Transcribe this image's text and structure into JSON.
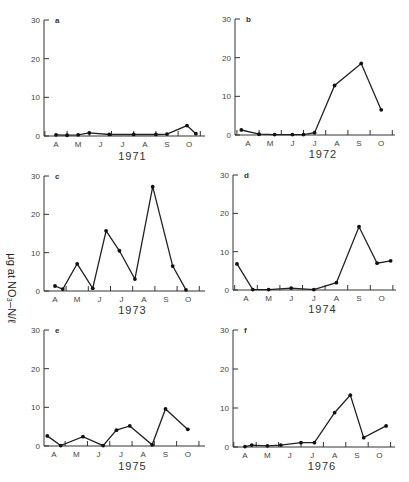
{
  "figure": {
    "ylabel": "μg at NO₃–N/ℓ"
  },
  "chart_data": [
    {
      "type": "line",
      "panel": "a",
      "title": "1971",
      "xlabel": "1971",
      "ylabel": "μg at NO₃–N/ℓ",
      "x_ticks": [
        "A",
        "M",
        "J",
        "J",
        "A",
        "S",
        "O"
      ],
      "yticks": [
        0,
        10,
        20,
        30
      ],
      "ylim": [
        0,
        30
      ],
      "grid": false,
      "x": [
        0.0,
        0.5,
        1.0,
        1.5,
        2.4,
        3.5,
        4.5,
        5.0,
        5.9,
        6.3
      ],
      "values": [
        0.3,
        0.2,
        0.3,
        0.8,
        0.4,
        0.4,
        0.4,
        0.5,
        2.7,
        0.6
      ]
    },
    {
      "type": "line",
      "panel": "b",
      "title": "1972",
      "xlabel": "1972",
      "ylabel": "μg at NO₃–N/ℓ",
      "x_ticks": [
        "A",
        "M",
        "J",
        "J",
        "A",
        "S",
        "O"
      ],
      "yticks": [
        0,
        10,
        20,
        30
      ],
      "ylim": [
        0,
        30
      ],
      "grid": false,
      "x": [
        -0.3,
        0.5,
        1.2,
        2.0,
        2.5,
        3.0,
        3.9,
        5.1,
        6.0
      ],
      "values": [
        1.3,
        0.2,
        0.1,
        0.1,
        0.1,
        0.6,
        12.8,
        18.5,
        6.5
      ]
    },
    {
      "type": "line",
      "panel": "c",
      "title": "1973",
      "xlabel": "1973",
      "ylabel": "μg at NO₃–N/ℓ",
      "x_ticks": [
        "A",
        "M",
        "J",
        "J",
        "A",
        "S",
        "O"
      ],
      "yticks": [
        0,
        10,
        20,
        30
      ],
      "ylim": [
        0,
        30
      ],
      "grid": false,
      "x": [
        0.0,
        0.35,
        1.0,
        1.7,
        2.3,
        2.9,
        3.6,
        4.4,
        5.3,
        5.9
      ],
      "values": [
        1.3,
        0.5,
        7.1,
        0.7,
        15.7,
        10.5,
        3.1,
        27.2,
        6.5,
        0.3
      ]
    },
    {
      "type": "line",
      "panel": "d",
      "title": "1974",
      "xlabel": "1974",
      "ylabel": "μg at NO₃–N/ℓ",
      "x_ticks": [
        "A",
        "M",
        "J",
        "J",
        "A",
        "S",
        "O"
      ],
      "yticks": [
        0,
        10,
        20,
        30
      ],
      "ylim": [
        0,
        30
      ],
      "grid": false,
      "x": [
        -0.4,
        0.3,
        1.0,
        2.0,
        3.0,
        4.0,
        5.0,
        5.8,
        6.4
      ],
      "values": [
        6.8,
        0.1,
        0.1,
        0.5,
        0.1,
        1.9,
        16.5,
        7.0,
        7.6
      ]
    },
    {
      "type": "line",
      "panel": "e",
      "title": "1975",
      "xlabel": "1975",
      "ylabel": "μg at NO₃–N/ℓ",
      "x_ticks": [
        "A",
        "M",
        "J",
        "J",
        "A",
        "S",
        "O"
      ],
      "yticks": [
        0,
        10,
        20,
        30
      ],
      "ylim": [
        0,
        30
      ],
      "grid": false,
      "x": [
        -0.3,
        0.3,
        1.3,
        2.2,
        2.8,
        3.4,
        4.4,
        5.0,
        6.0
      ],
      "values": [
        2.6,
        0.1,
        2.4,
        0.1,
        4.1,
        5.2,
        0.3,
        9.6,
        4.3
      ]
    },
    {
      "type": "line",
      "panel": "f",
      "title": "1976",
      "xlabel": "1976",
      "ylabel": "μg at NO₃–N/ℓ",
      "x_ticks": [
        "A",
        "M",
        "J",
        "J",
        "A",
        "S",
        "O"
      ],
      "yticks": [
        0,
        10,
        20,
        30
      ],
      "ylim": [
        0,
        30
      ],
      "grid": false,
      "x": [
        0.0,
        0.3,
        1.0,
        1.6,
        2.5,
        3.1,
        4.0,
        4.7,
        5.3,
        6.3
      ],
      "values": [
        0.1,
        0.5,
        0.3,
        0.5,
        1.1,
        1.1,
        8.8,
        13.3,
        2.4,
        5.4
      ]
    }
  ]
}
